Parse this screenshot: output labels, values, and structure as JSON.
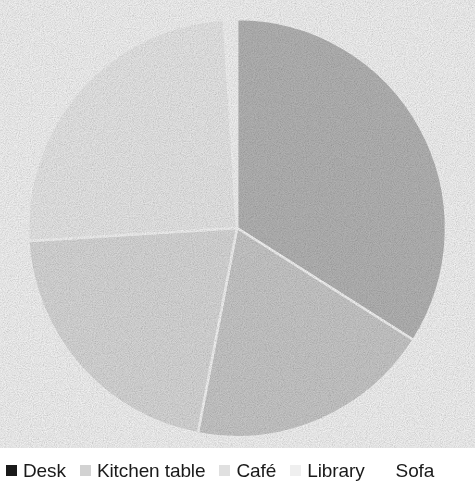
{
  "chart_data": {
    "type": "pie",
    "title": "",
    "subtitle": "",
    "xlabel": "",
    "ylabel": "",
    "grid": false,
    "legend_position": "bottom",
    "start_angle_deg": 0,
    "direction": "clockwise",
    "categories": [
      "Desk",
      "Kitchen table",
      "Café",
      "Library",
      "Sofa"
    ],
    "values": [
      34,
      19,
      21,
      25,
      1
    ],
    "colors": [
      "#bdbdbd",
      "#d2d2d2",
      "#e3e3e3",
      "#f3f3f3",
      "#ffffff"
    ],
    "slices": [
      {
        "label": "Desk",
        "value": 34,
        "percent": "34%",
        "color": "#bdbdbd",
        "start_deg": 0,
        "end_deg": 122.4
      },
      {
        "label": "Kitchen table",
        "value": 19,
        "percent": "19%",
        "color": "#d2d2d2",
        "start_deg": 122.4,
        "end_deg": 190.8
      },
      {
        "label": "Café",
        "value": 21,
        "percent": "21%",
        "color": "#e3e3e3",
        "start_deg": 190.8,
        "end_deg": 266.4
      },
      {
        "label": "Library",
        "value": 25,
        "percent": "25%",
        "color": "#f3f3f3",
        "start_deg": 266.4,
        "end_deg": 356.4
      },
      {
        "label": "Sofa",
        "value": 1,
        "percent": "1%",
        "color": "#ffffff",
        "start_deg": 356.4,
        "end_deg": 360
      }
    ]
  },
  "pie": {
    "center_x": 237,
    "center_y": 228,
    "radius": 209,
    "slice_gap_color": "#ffffff",
    "slice_gap_width": 2.5
  },
  "legend": {
    "items": [
      {
        "label": "Desk",
        "swatch_color": "#1a1a1a",
        "swatch_name": "legend-swatch-desk"
      },
      {
        "label": "Kitchen table",
        "swatch_color": "#d2d2d2",
        "swatch_name": "legend-swatch-kitchen-table"
      },
      {
        "label": "Café",
        "swatch_color": "#e0e0e0",
        "swatch_name": "legend-swatch-cafe"
      },
      {
        "label": "Library",
        "swatch_color": "#efefef",
        "swatch_name": "legend-swatch-library"
      },
      {
        "label": "Sofa",
        "swatch_color": "#ffffff",
        "swatch_name": "legend-swatch-sofa"
      }
    ]
  }
}
